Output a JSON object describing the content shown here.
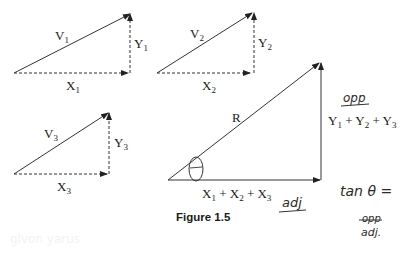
{
  "figure": {
    "caption": "Figure 1.5",
    "vectors": [
      {
        "name": "V1",
        "label": "V",
        "sub": "1",
        "x_label": "X",
        "x_sub": "1",
        "y_label": "Y",
        "y_sub": "1"
      },
      {
        "name": "V2",
        "label": "V",
        "sub": "2",
        "x_label": "X",
        "x_sub": "2",
        "y_label": "Y",
        "y_sub": "2"
      },
      {
        "name": "V3",
        "label": "V",
        "sub": "3",
        "x_label": "X",
        "x_sub": "3",
        "y_label": "Y",
        "y_sub": "3"
      }
    ],
    "resultant": {
      "label": "R",
      "x_sum": {
        "X": "X",
        "s1": "1",
        "plus1": " + X",
        "s2": "2",
        "plus2": " + X",
        "s3": "3"
      },
      "y_sum": {
        "Y": "Y",
        "s1": "1",
        "plus1": " + Y",
        "s2": "2",
        "plus2": " + Y",
        "s3": "3"
      },
      "angle_symbol": "θ"
    },
    "annotations": {
      "opp": "opp",
      "adj": "adj",
      "tan_eq": "tan θ =",
      "frac_num": "opp",
      "frac_den": "adj."
    },
    "faint_bleed_text": "glvon yarus"
  }
}
